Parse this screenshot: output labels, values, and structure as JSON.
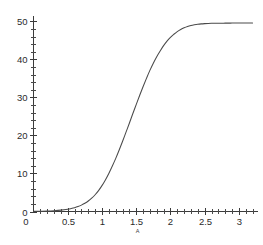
{
  "chart_data": {
    "type": "line",
    "title": "",
    "subtitle": "",
    "xlabel": "A",
    "ylabel": "",
    "xlim": [
      0,
      3.25
    ],
    "ylim": [
      0,
      51
    ],
    "grid": false,
    "legend": null,
    "x_ticks_major": [
      0.5,
      1,
      1.5,
      2,
      2.5,
      3
    ],
    "x_tick_labels": [
      "0.5",
      "1",
      "1.5",
      "2",
      "2.5",
      "3"
    ],
    "x_tick_minor_step": 0.1,
    "y_ticks_major": [
      0,
      10,
      20,
      30,
      40,
      50
    ],
    "y_tick_labels": [
      "0",
      "10",
      "20",
      "30",
      "40",
      "50"
    ],
    "y_tick_minor_step": 2,
    "series": [
      {
        "name": "curve",
        "color": "#4a4a4a",
        "x": [
          0.0,
          0.1,
          0.2,
          0.3,
          0.4,
          0.5,
          0.55,
          0.6,
          0.65,
          0.7,
          0.75,
          0.8,
          0.85,
          0.9,
          0.95,
          1.0,
          1.05,
          1.1,
          1.15,
          1.2,
          1.25,
          1.3,
          1.35,
          1.4,
          1.45,
          1.5,
          1.55,
          1.6,
          1.65,
          1.7,
          1.75,
          1.8,
          1.85,
          1.9,
          1.95,
          2.0,
          2.05,
          2.1,
          2.15,
          2.2,
          2.25,
          2.3,
          2.35,
          2.4,
          2.45,
          2.5,
          2.55,
          2.6,
          2.65,
          2.7,
          2.75,
          2.8,
          2.85,
          2.9,
          2.95,
          3.0,
          3.05,
          3.1,
          3.15,
          3.2
        ],
        "y": [
          0.05,
          0.08,
          0.13,
          0.22,
          0.36,
          0.6,
          0.78,
          1.0,
          1.3,
          1.68,
          2.15,
          2.75,
          3.5,
          4.4,
          5.5,
          6.8,
          8.3,
          10.0,
          11.9,
          13.9,
          16.1,
          18.4,
          20.8,
          23.2,
          25.7,
          28.1,
          30.5,
          32.8,
          35.0,
          37.1,
          39.0,
          40.7,
          42.2,
          43.6,
          44.8,
          45.8,
          46.6,
          47.3,
          47.85,
          48.3,
          48.65,
          48.9,
          49.08,
          49.22,
          49.32,
          49.39,
          49.44,
          49.47,
          49.49,
          49.5,
          49.51,
          49.52,
          49.52,
          49.53,
          49.53,
          49.53,
          49.53,
          49.53,
          49.53,
          49.53
        ]
      }
    ],
    "asymptote": 49.5
  },
  "axis": {
    "x_name": "A",
    "origin_label": "0"
  }
}
